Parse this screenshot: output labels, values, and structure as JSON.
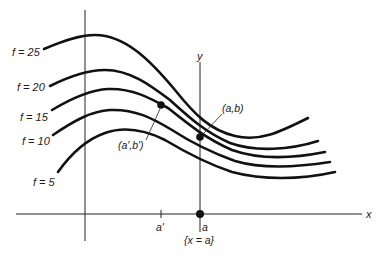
{
  "diagram": {
    "type": "level-curves",
    "colors": {
      "ink": "#111111",
      "background": "#ffffff"
    },
    "axes": {
      "x_label": "x",
      "y_label": "y"
    },
    "level_curves": [
      {
        "label": "f = 25",
        "value": 25
      },
      {
        "label": "f = 20",
        "value": 20
      },
      {
        "label": "f = 15",
        "value": 15
      },
      {
        "label": "f = 10",
        "value": 10
      },
      {
        "label": "f = 5",
        "value": 5
      }
    ],
    "points": {
      "ab": "(a,b)",
      "ab_prime": "(a',b')"
    },
    "ticks": {
      "a_prime": "a'",
      "a": "a"
    },
    "line_label": "{x = a}"
  }
}
